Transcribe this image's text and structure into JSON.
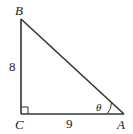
{
  "diagram": {
    "type": "right-triangle",
    "vertices": {
      "B": {
        "label": "B",
        "x": 21,
        "y": 19
      },
      "C": {
        "label": "C",
        "x": 21,
        "y": 114
      },
      "A": {
        "label": "A",
        "x": 124,
        "y": 114
      }
    },
    "sides": {
      "BC": {
        "label": "8"
      },
      "CA": {
        "label": "9"
      }
    },
    "angle": {
      "at": "A",
      "label": "θ"
    },
    "right_angle_at": "C",
    "colors": {
      "stroke": "#333333",
      "text": "#222222",
      "background": "#ffffff"
    }
  }
}
